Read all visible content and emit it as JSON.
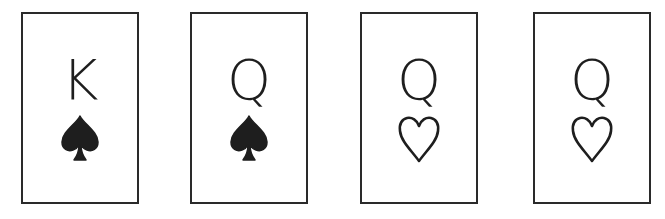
{
  "cards": [
    {
      "rank": "K",
      "suit": "spade",
      "suit_symbol": "♠",
      "filled": true
    },
    {
      "rank": "Q",
      "suit": "spade",
      "suit_symbol": "♠",
      "filled": true
    },
    {
      "rank": "Q",
      "suit": "heart",
      "suit_symbol": "♡",
      "filled": false
    },
    {
      "rank": "Q",
      "suit": "heart",
      "suit_symbol": "♡",
      "filled": false
    }
  ],
  "colors": {
    "ink": "#1e1e1e",
    "card_border": "#2a2a2a",
    "background": "#ffffff"
  }
}
